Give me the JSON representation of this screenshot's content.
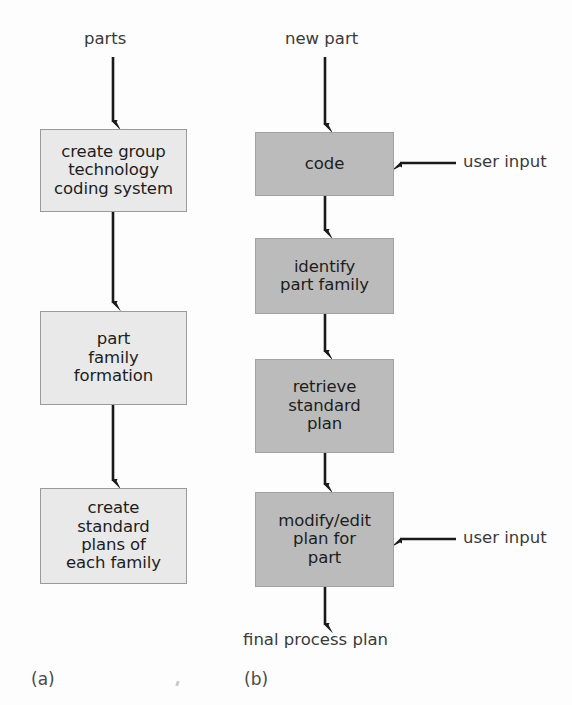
{
  "figure": {
    "panels": [
      {
        "id": "a",
        "caption": "(a)",
        "input_label": "parts",
        "steps": [
          {
            "label": "create group\ntechnology\ncoding system"
          },
          {
            "label": "part\nfamily\nformation"
          },
          {
            "label": "create\nstandard\nplans of\neach family"
          }
        ]
      },
      {
        "id": "b",
        "caption": "(b)",
        "input_label": "new part",
        "output_label": "final process plan",
        "steps": [
          {
            "label": "code",
            "side_input": "user input"
          },
          {
            "label": "identify\npart family",
            "side_input": null
          },
          {
            "label": "retrieve\nstandard\nplan",
            "side_input": null
          },
          {
            "label": "modify/edit\nplan for\npart",
            "side_input": "user input"
          }
        ]
      }
    ],
    "side_inputs": [
      {
        "label": "user input"
      },
      {
        "label": "user input"
      }
    ],
    "colors": {
      "background": "#fdfdfd",
      "box_light_fill": "#e9e9e9",
      "box_light_border": "#9a9a9a",
      "box_dark_fill": "#bbbbbb",
      "box_dark_border": "#a2a2a2",
      "arrow": "#1a1a1a",
      "text": "#1d1d1d",
      "label_text": "#3a3a3a"
    }
  }
}
